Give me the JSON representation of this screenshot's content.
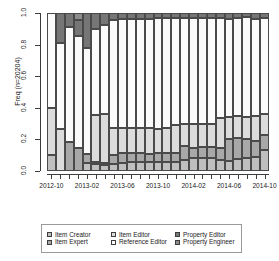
{
  "chart_data": {
    "type": "bar",
    "subtype": "stacked-100-percent",
    "title": "",
    "xlabel": "",
    "ylabel": "Freq  (n=20204)",
    "ylim": [
      0,
      1
    ],
    "ytick_values": [
      0.0,
      0.2,
      0.4,
      0.6,
      0.8,
      1.0
    ],
    "ytick_labels": [
      "0.0",
      "0.2",
      "0.4",
      "0.6",
      "0.8",
      "1.0"
    ],
    "grid": false,
    "legend_position": "bottom",
    "n_total": 20204,
    "categories": [
      "2012-10",
      "2012-11",
      "2012-12",
      "2013-01",
      "2013-02",
      "2013-03",
      "2013-04",
      "2013-05",
      "2013-06",
      "2013-07",
      "2013-08",
      "2013-09",
      "2013-10",
      "2013-11",
      "2013-12",
      "2014-01",
      "2014-02",
      "2014-03",
      "2014-04",
      "2014-05",
      "2014-06",
      "2014-07",
      "2014-08",
      "2014-09",
      "2014-10"
    ],
    "xtick_labels": [
      "2012-10",
      "2013-02",
      "2013-06",
      "2013-10",
      "2014-02",
      "2014-06",
      "2014-10"
    ],
    "xtick_indices": [
      0,
      4,
      8,
      12,
      16,
      20,
      24
    ],
    "series": [
      {
        "name": "Item Creator",
        "color": "#bfbfbf",
        "values": [
          0.1,
          0.0,
          0.0,
          0.0,
          0.05,
          0.045,
          0.04,
          0.045,
          0.05,
          0.055,
          0.055,
          0.055,
          0.055,
          0.055,
          0.055,
          0.07,
          0.085,
          0.08,
          0.08,
          0.07,
          0.065,
          0.075,
          0.085,
          0.09,
          0.13
        ]
      },
      {
        "name": "Item Expert",
        "color": "#a8a8a8",
        "values": [
          0.0,
          0.0,
          0.185,
          0.145,
          0.06,
          0.01,
          0.01,
          0.055,
          0.065,
          0.06,
          0.06,
          0.05,
          0.06,
          0.06,
          0.06,
          0.085,
          0.06,
          0.07,
          0.07,
          0.075,
          0.14,
          0.135,
          0.12,
          0.1,
          0.095
        ]
      },
      {
        "name": "Item Editor",
        "color": "#dcdcdc",
        "values": [
          0.3,
          0.265,
          0.0,
          0.0,
          0.0,
          0.3,
          0.31,
          0.175,
          0.155,
          0.155,
          0.16,
          0.165,
          0.15,
          0.155,
          0.175,
          0.14,
          0.15,
          0.15,
          0.145,
          0.19,
          0.135,
          0.135,
          0.135,
          0.155,
          0.135
        ]
      },
      {
        "name": "Reference Editor",
        "color": "#fbfbfb",
        "values": [
          0.6,
          0.545,
          0.725,
          0.71,
          0.67,
          0.545,
          0.565,
          0.68,
          0.69,
          0.69,
          0.685,
          0.69,
          0.705,
          0.7,
          0.68,
          0.675,
          0.675,
          0.67,
          0.675,
          0.635,
          0.625,
          0.625,
          0.635,
          0.62,
          0.61
        ]
      },
      {
        "name": "Property Editor",
        "color": "#767676",
        "values": [
          0.0,
          0.19,
          0.09,
          0.1,
          0.22,
          0.1,
          0.075,
          0.045,
          0.04,
          0.04,
          0.04,
          0.04,
          0.03,
          0.03,
          0.03,
          0.03,
          0.03,
          0.03,
          0.03,
          0.03,
          0.035,
          0.03,
          0.025,
          0.035,
          0.03
        ]
      },
      {
        "name": "Property Engineer",
        "color": "#8c8c8c",
        "values": [
          0.0,
          0.0,
          0.0,
          0.045,
          0.0,
          0.0,
          0.0,
          0.0,
          0.0,
          0.0,
          0.0,
          0.0,
          0.0,
          0.0,
          0.0,
          0.0,
          0.0,
          0.0,
          0.0,
          0.0,
          0.0,
          0.0,
          0.0,
          0.0,
          0.0
        ]
      }
    ]
  },
  "axis": {
    "y_title": "Freq  (n=20204)"
  },
  "legend": {
    "items": [
      {
        "label": "Item Creator",
        "color": "#bfbfbf"
      },
      {
        "label": "Item Editor",
        "color": "#dcdcdc"
      },
      {
        "label": "Property Editor",
        "color": "#767676"
      },
      {
        "label": "Item Expert",
        "color": "#a8a8a8"
      },
      {
        "label": "Reference Editor",
        "color": "#fbfbfb"
      },
      {
        "label": "Property Engineer",
        "color": "#8c8c8c"
      }
    ]
  }
}
